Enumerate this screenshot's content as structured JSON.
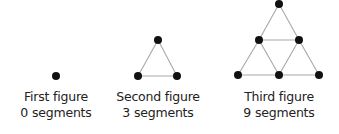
{
  "colors": {
    "node": "#111111",
    "edge": "#a8a8a8",
    "text": "#222222"
  },
  "figures": [
    {
      "title": "First figure",
      "segments_label": "0 segments",
      "segments": 0,
      "nodes": [
        [
          56,
          76
        ]
      ],
      "edges": []
    },
    {
      "title": "Second figure",
      "segments_label": "3 segments",
      "segments": 3,
      "nodes": [
        [
          158,
          40
        ],
        [
          138,
          76
        ],
        [
          177,
          76
        ]
      ],
      "edges": [
        [
          0,
          1
        ],
        [
          0,
          2
        ],
        [
          1,
          2
        ]
      ]
    },
    {
      "title": "Third figure",
      "segments_label": "9 segments",
      "segments": 9,
      "nodes": [
        [
          279,
          4
        ],
        [
          259,
          40
        ],
        [
          299,
          40
        ],
        [
          238,
          75
        ],
        [
          279,
          75
        ],
        [
          319,
          75
        ]
      ],
      "edges": [
        [
          0,
          1
        ],
        [
          0,
          2
        ],
        [
          1,
          2
        ],
        [
          1,
          3
        ],
        [
          1,
          4
        ],
        [
          2,
          4
        ],
        [
          2,
          5
        ],
        [
          3,
          4
        ],
        [
          4,
          5
        ]
      ]
    }
  ]
}
